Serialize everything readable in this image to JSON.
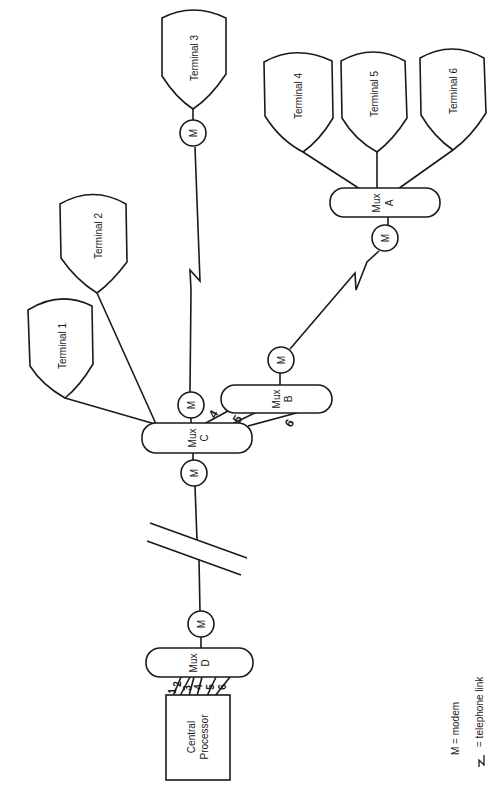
{
  "diagram": {
    "orientation": "rotated-90-clockwise",
    "terminals": [
      {
        "id": "t1",
        "label": "Terminal 1"
      },
      {
        "id": "t2",
        "label": "Terminal 2"
      },
      {
        "id": "t3",
        "label": "Terminal 3"
      },
      {
        "id": "t4",
        "label": "Terminal 4"
      },
      {
        "id": "t5",
        "label": "Terminal 5"
      },
      {
        "id": "t6",
        "label": "Terminal 6"
      }
    ],
    "multiplexers": [
      {
        "id": "muxA",
        "line1": "Mux",
        "line2": "A"
      },
      {
        "id": "muxB",
        "line1": "Mux",
        "line2": "B"
      },
      {
        "id": "muxC",
        "line1": "Mux",
        "line2": "C"
      },
      {
        "id": "muxD",
        "line1": "Mux",
        "line2": "D"
      }
    ],
    "modem_label": "M",
    "processor": {
      "line1": "Central",
      "line2": "Processor"
    },
    "channel_numbers_muxD": [
      "1",
      "2",
      "3",
      "4",
      "5",
      "6"
    ],
    "channel_numbers_muxB_to_muxC": [
      "4",
      "5",
      "6"
    ],
    "legend": {
      "modem": "M = modem",
      "telephone_link": "= telephone link"
    }
  }
}
